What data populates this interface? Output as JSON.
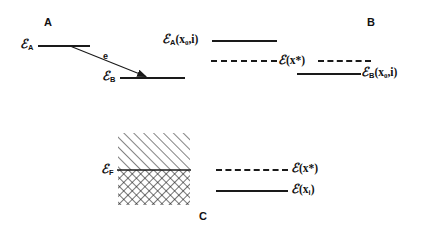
{
  "figure": {
    "background_color": "#ffffff",
    "line_color": "#1a1a1a",
    "width": 424,
    "height": 228
  },
  "panels": {
    "a": {
      "letter": "A",
      "levels": [
        {
          "name": "level-a-upper",
          "label_base": "ℰ",
          "label_sub": "A",
          "x": 38,
          "y": 45,
          "width": 52
        },
        {
          "name": "level-a-lower",
          "label_base": "ℰ",
          "label_sub": "B",
          "x": 120,
          "y": 77,
          "width": 65
        }
      ],
      "transition": {
        "name": "electron-transition-arrow",
        "label": "e",
        "label_x": 103,
        "label_y": 52,
        "from_x": 70,
        "from_y": 46,
        "to_x": 145,
        "to_y": 76
      }
    },
    "b": {
      "letter": "B",
      "levels": [
        {
          "name": "level-b-upper",
          "label_base": "ℰ",
          "label_sub": "A",
          "label_args": "(x₀,i)",
          "x": 212,
          "y": 40,
          "width": 65
        },
        {
          "name": "level-b-lower",
          "label_base": "ℰ",
          "label_sub": "B",
          "label_args": "(x₀,i)",
          "x": 297,
          "y": 73,
          "width": 64
        }
      ],
      "dashed_level": {
        "name": "level-b-transition-state",
        "label_base": "ℰ",
        "label_args": "(x*)",
        "x": 211,
        "y": 60,
        "width": 160
      }
    },
    "c": {
      "letter": "C",
      "fermi_label_base": "ℰ",
      "fermi_label_sub": "F",
      "box": {
        "name": "band-occupancy-box",
        "x": 118,
        "y": 133,
        "width": 72,
        "height": 72,
        "divider_y": 170,
        "upper_fill": "single-hatch",
        "lower_fill": "cross-hatch"
      },
      "legend": [
        {
          "name": "legend-transition-state",
          "style": "dashed",
          "label_base": "ℰ",
          "label_args": "(x*)",
          "line_x": 216,
          "line_y": 169,
          "line_width": 72,
          "text_x": 292,
          "text_y": 163
        },
        {
          "name": "legend-initial-state",
          "style": "solid",
          "label_base": "ℰ",
          "label_args": "(x",
          "label_sub": "i",
          "label_close": ")",
          "line_x": 216,
          "line_y": 190,
          "line_width": 72,
          "text_x": 292,
          "text_y": 184
        }
      ]
    }
  }
}
